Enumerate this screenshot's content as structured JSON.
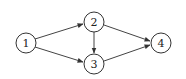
{
  "diagram": {
    "type": "directed-graph",
    "nodes": [
      {
        "id": "1",
        "label": "1",
        "cx": 26,
        "cy": 43,
        "r": 10
      },
      {
        "id": "2",
        "label": "2",
        "cx": 94,
        "cy": 22,
        "r": 10
      },
      {
        "id": "3",
        "label": "3",
        "cx": 94,
        "cy": 64,
        "r": 10
      },
      {
        "id": "4",
        "label": "4",
        "cx": 161,
        "cy": 43,
        "r": 10
      }
    ],
    "edges": [
      {
        "from": "1",
        "to": "2"
      },
      {
        "from": "1",
        "to": "3"
      },
      {
        "from": "2",
        "to": "3"
      },
      {
        "from": "2",
        "to": "4"
      },
      {
        "from": "3",
        "to": "4"
      }
    ],
    "colors": {
      "stroke": "#333333",
      "background": "#ffffff"
    }
  }
}
